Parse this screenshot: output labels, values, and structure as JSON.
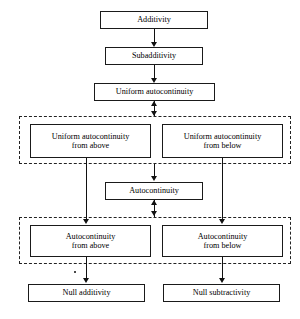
{
  "diagram": {
    "canvas": {
      "width": 300,
      "height": 319,
      "background": "#ffffff"
    },
    "colors": {
      "box_border": "#1a1a1a",
      "group_border": "#222222",
      "edge": "#111111",
      "text": "#000000",
      "background": "#ffffff"
    },
    "nodes": [
      {
        "id": "additivity",
        "label": "Additivity",
        "lines": [
          "Additivity"
        ],
        "x": 100,
        "y": 11,
        "w": 108,
        "h": 18
      },
      {
        "id": "subadditivity",
        "label": "Subadditivity",
        "lines": [
          "Subadditivity"
        ],
        "x": 105,
        "y": 47,
        "w": 98,
        "h": 18
      },
      {
        "id": "uniform-autocontinuity",
        "label": "Uniform autocontinuity",
        "lines": [
          "Uniform autocontinuity"
        ],
        "x": 94,
        "y": 83,
        "w": 121,
        "h": 18
      },
      {
        "id": "uniform-autocontinuity-from-above",
        "label": "Uniform autocontinuity from above",
        "lines": [
          "Uniform autocontinuity",
          "from above"
        ],
        "x": 30,
        "y": 124,
        "w": 121,
        "h": 34
      },
      {
        "id": "uniform-autocontinuity-from-below",
        "label": "Uniform autocontinuity from below",
        "lines": [
          "Uniform autocontinuity",
          "from below"
        ],
        "x": 162,
        "y": 124,
        "w": 121,
        "h": 34
      },
      {
        "id": "autocontinuity",
        "label": "Autocontinuity",
        "lines": [
          "Autocontinuity"
        ],
        "x": 105,
        "y": 182,
        "w": 98,
        "h": 18
      },
      {
        "id": "autocontinuity-from-above",
        "label": "Autocontinuity from above",
        "lines": [
          "Autocontinuity",
          "from above"
        ],
        "x": 30,
        "y": 225,
        "w": 121,
        "h": 32
      },
      {
        "id": "autocontinuity-from-below",
        "label": "Autocontinuity from below",
        "lines": [
          "Autocontinuity",
          "from below"
        ],
        "x": 162,
        "y": 225,
        "w": 121,
        "h": 32
      },
      {
        "id": "null-additivity",
        "label": "Null additivity",
        "lines": [
          "Null additivity"
        ],
        "x": 28,
        "y": 284,
        "w": 117,
        "h": 18
      },
      {
        "id": "null-subtractivity",
        "label": "Null subtractivity",
        "lines": [
          "Null subtractivity"
        ],
        "x": 163,
        "y": 284,
        "w": 117,
        "h": 18
      }
    ],
    "groups": [
      {
        "id": "uniform-group",
        "x": 19,
        "y": 116,
        "w": 272,
        "h": 48
      },
      {
        "id": "autocontinuity-group",
        "x": 19,
        "y": 217,
        "w": 272,
        "h": 47
      }
    ],
    "edges": [
      {
        "id": "additivity-to-subadditivity",
        "from": "additivity",
        "to": "subadditivity",
        "kind": "arrow-down"
      },
      {
        "id": "subadditivity-to-uniform-autocontinuity",
        "from": "subadditivity",
        "to": "uniform-autocontinuity",
        "kind": "arrow-down"
      },
      {
        "id": "uniform-autocontinuity-to-uniform-group",
        "from": "uniform-autocontinuity",
        "to": "uniform-group",
        "kind": "double-arrow"
      },
      {
        "id": "uniform-group-to-autocontinuity",
        "from": "uniform-group",
        "to": "autocontinuity",
        "kind": "arrow-down"
      },
      {
        "id": "autocontinuity-to-autocontinuity-group",
        "from": "autocontinuity",
        "to": "autocontinuity-group",
        "kind": "double-arrow"
      },
      {
        "id": "uniform-above-to-autocontinuity-above",
        "from": "uniform-autocontinuity-from-above",
        "to": "autocontinuity-from-above",
        "kind": "arrow-down"
      },
      {
        "id": "uniform-below-to-autocontinuity-below",
        "from": "uniform-autocontinuity-from-below",
        "to": "autocontinuity-from-below",
        "kind": "arrow-down"
      },
      {
        "id": "autocontinuity-above-to-null-additivity",
        "from": "autocontinuity-from-above",
        "to": "null-additivity",
        "kind": "arrow-down"
      },
      {
        "id": "autocontinuity-below-to-null-subtractivity",
        "from": "autocontinuity-from-below",
        "to": "null-subtractivity",
        "kind": "arrow-down"
      }
    ]
  }
}
